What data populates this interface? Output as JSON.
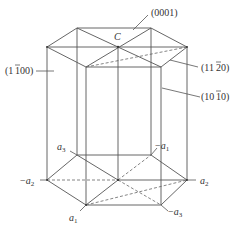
{
  "diagram": {
    "planes": {
      "basal": "(0001)",
      "prism_first_order": "(1̄1̄00)",
      "pyramidal": "(112̄0)",
      "prism_second": "(101̄0)"
    },
    "plane_labels": [
      {
        "id": "basal",
        "text": "(0001)"
      },
      {
        "id": "prism_left",
        "text": "(1100)",
        "overbar_index": 1
      },
      {
        "id": "plane_1120",
        "text": "(1120)",
        "overbar_index": 2
      },
      {
        "id": "plane_1010",
        "text": "(1010)",
        "overbar_index": 2
      }
    ],
    "c_axis_label": "C",
    "axes": [
      {
        "name": "a3",
        "label": "a",
        "sub": "3",
        "sign": ""
      },
      {
        "name": "-a1",
        "label": "a",
        "sub": "1",
        "sign": "−"
      },
      {
        "name": "-a2",
        "label": "a",
        "sub": "2",
        "sign": "−"
      },
      {
        "name": "a2",
        "label": "a",
        "sub": "2",
        "sign": ""
      },
      {
        "name": "a1",
        "label": "a",
        "sub": "1",
        "sign": ""
      },
      {
        "name": "-a3",
        "label": "a",
        "sub": "3",
        "sign": "−"
      }
    ],
    "colors": {
      "line": "#555555",
      "text": "#333333",
      "background": "#ffffff"
    }
  }
}
